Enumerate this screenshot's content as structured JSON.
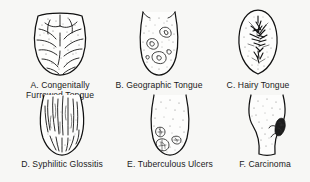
{
  "plate": {
    "title": "Tongue Conditions",
    "background_color": "#f7f7f5",
    "ink_color": "#111111",
    "figure_count": 6,
    "layout": "3 columns x 2 rows"
  },
  "figures": [
    {
      "key": "A",
      "letter": "A.",
      "name": "Congenitally Furrowed Tongue",
      "caption": "A. Congenitally\nFurrowed Tongue",
      "icon": "tongue-furrowed-icon",
      "features": "deep branching furrows and fissures across dorsum, stippled surface"
    },
    {
      "key": "B",
      "letter": "B.",
      "name": "Geographic Tongue",
      "caption": "B. Geographic Tongue",
      "icon": "tongue-geographic-icon",
      "features": "irregular map-like patches with serpiginous borders, scattered stippling"
    },
    {
      "key": "C",
      "letter": "C.",
      "name": "Hairy Tongue",
      "caption": "C. Hairy Tongue",
      "icon": "tongue-hairy-icon",
      "features": "dense dark hair-like filiform papillae clustered along midline"
    },
    {
      "key": "D",
      "letter": "D.",
      "name": "Syphilitic Glossitis",
      "caption": "D. Syphilitic Glossitis",
      "icon": "tongue-syphilitic-icon",
      "features": "long vertical linear fissures and atrophic streaks over entire dorsum"
    },
    {
      "key": "E",
      "letter": "E.",
      "name": "Tuberculous Ulcers",
      "caption": "E. Tuberculous Ulcers",
      "icon": "tongue-tuberculous-icon",
      "features": "three discrete rounded ulcers with ragged undermined edges near the tip"
    },
    {
      "key": "F",
      "letter": "F.",
      "name": "Carcinoma",
      "caption": "F. Carcinoma",
      "icon": "tongue-carcinoma-icon",
      "features": "dark irregular indurated mass on right lateral border, waisted outline"
    }
  ]
}
